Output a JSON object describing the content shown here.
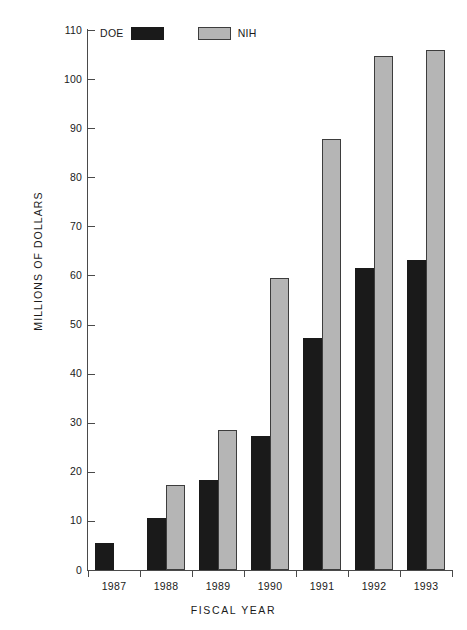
{
  "chart_data": {
    "type": "bar",
    "title": "",
    "xlabel": "FISCAL YEAR",
    "ylabel": "MILLIONS OF DOLLARS",
    "categories": [
      "1987",
      "1988",
      "1989",
      "1990",
      "1991",
      "1992",
      "1993"
    ],
    "ylim": [
      0,
      110
    ],
    "yticks": [
      0,
      10,
      20,
      30,
      40,
      50,
      60,
      70,
      80,
      90,
      100,
      110
    ],
    "ytick_labels": [
      "0",
      "10",
      "20",
      "30",
      "40",
      "50",
      "60",
      "70",
      "80",
      "90",
      "100",
      "110"
    ],
    "grid": false,
    "legend_position": "top-left",
    "series": [
      {
        "name": "DOE",
        "color": "#1a1a1a",
        "values": [
          5.5,
          10.5,
          18.4,
          27.4,
          47.3,
          61.5,
          63.2
        ]
      },
      {
        "name": "NIH",
        "color": "#b5b5b5",
        "values": [
          null,
          17.3,
          28.5,
          59.5,
          87.7,
          104.8,
          106.0
        ]
      }
    ]
  },
  "legend": {
    "entries": [
      {
        "label": "DOE",
        "swatch": "black-filled-swatch"
      },
      {
        "label": "NIH",
        "swatch": "gray-filled-swatch"
      }
    ]
  }
}
